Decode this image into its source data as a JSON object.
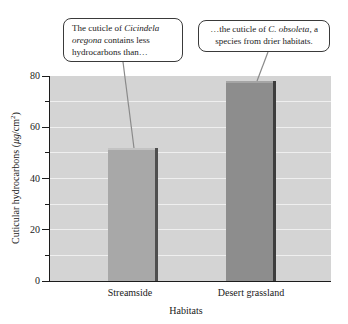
{
  "annotations": {
    "left": {
      "prefix": "The cuticle of ",
      "species": "Cicindela oregona",
      "suffix": " contains less hydrocarbons than…"
    },
    "right": {
      "prefix": "…the cuticle of ",
      "species": "C. obsoleta",
      "suffix": ", a species from drier habitats."
    }
  },
  "axis": {
    "xlabel": "Habitats",
    "ylabel": {
      "prefix": "Cuticular hydrocarbons (",
      "unit": "μg",
      "mid": "/cm",
      "sup": "2",
      "close": ")"
    }
  },
  "chart_data": {
    "type": "bar",
    "title": "",
    "categories": [
      "Streamside",
      "Desert grassland"
    ],
    "values": [
      52,
      78
    ],
    "xlabel": "Habitats",
    "ylabel": "Cuticular hydrocarbons (μg/cm²)",
    "ylim": [
      0,
      80
    ],
    "yticks_major": [
      0,
      20,
      40,
      60,
      80
    ],
    "yticks_minor": [
      10,
      30,
      50,
      70
    ],
    "gridlines": [
      10,
      20,
      30,
      40,
      50,
      60,
      70
    ],
    "grid_on": true,
    "legend": null,
    "bar_colors": [
      "#a8a8a8",
      "#8d8d8d"
    ],
    "plot_bg": "#d4d4d4",
    "grid_color": "#efefef",
    "annotation_left_target": "Streamside bar top",
    "annotation_right_target": "Desert grassland bar top"
  }
}
